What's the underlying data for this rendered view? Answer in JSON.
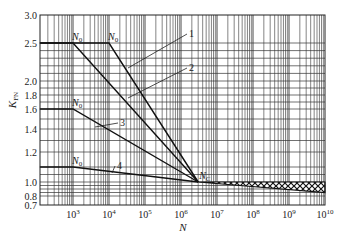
{
  "chart_data": {
    "type": "line",
    "title": "",
    "xlabel": "N",
    "ylabel": "K_FN",
    "xscale": "log",
    "xlim": [
      120,
      10000000000
    ],
    "ylim": [
      0.7,
      3.0
    ],
    "grid": true,
    "x_tick_labels": [
      "10^3",
      "10^4",
      "10^5",
      "10^6",
      "10^7",
      "10^8",
      "10^9",
      "10^10"
    ],
    "y_tick_labels": [
      "0.7",
      "0.8",
      "1.0",
      "1.2",
      "1.4",
      "1.6",
      "1.8",
      "2.0",
      "2.5",
      "3.0"
    ],
    "series": [
      {
        "name": "1",
        "points": [
          [
            120,
            2.5
          ],
          [
            10000,
            2.5
          ],
          [
            3000000,
            1.0
          ]
        ],
        "knee_label": "N0"
      },
      {
        "name": "2",
        "points": [
          [
            120,
            2.5
          ],
          [
            1000,
            2.5
          ],
          [
            3000000,
            1.0
          ]
        ],
        "knee_label": "N0"
      },
      {
        "name": "3",
        "points": [
          [
            120,
            1.6
          ],
          [
            1000,
            1.6
          ],
          [
            3000000,
            1.0
          ]
        ],
        "knee_label": "N0"
      },
      {
        "name": "4",
        "points": [
          [
            120,
            1.1
          ],
          [
            1000,
            1.1
          ],
          [
            3000000,
            1.0
          ]
        ],
        "knee_label": "N0"
      }
    ],
    "convergence_point": {
      "label": "Nc",
      "N": 3000000,
      "K": 1.0
    },
    "tail_band": {
      "from_N": 3000000,
      "to_N": 10000000000,
      "upper_K": [
        1.0,
        1.0
      ],
      "lower_K": [
        1.0,
        0.85
      ],
      "pattern": "crosshatch"
    },
    "annotations": [
      "N0",
      "N0",
      "N0",
      "N0",
      "Nc",
      "1",
      "2",
      "3",
      "4"
    ]
  },
  "labels": {
    "xlabel": "N",
    "ylabel_main": "K",
    "ylabel_sub": "FN",
    "knee": "N",
    "knee_sub": "0",
    "conv": "N",
    "conv_sub": "C"
  }
}
